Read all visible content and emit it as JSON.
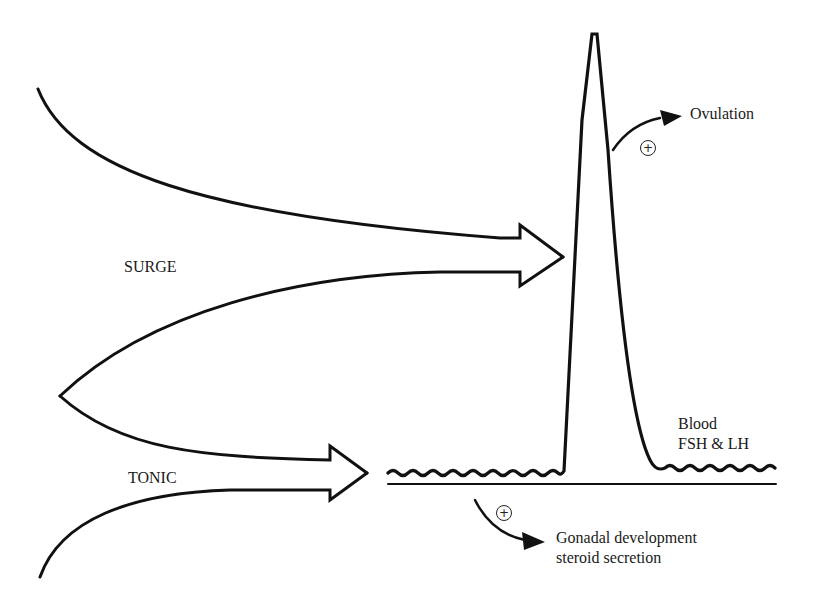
{
  "diagram": {
    "type": "hormone-secretion-schematic",
    "labels": {
      "surge": "SURGE",
      "tonic": "TONIC",
      "ovulation": "Ovulation",
      "blood_line1": "Blood",
      "blood_line2": "FSH & LH",
      "gonadal_line1": "Gonadal development",
      "gonadal_line2": "steroid secretion",
      "plus_sign": "+"
    },
    "colors": {
      "stroke": "#111111",
      "background": "#ffffff",
      "text": "#1a1a1a"
    },
    "nodes": [
      {
        "id": "surge-center",
        "label": "SURGE"
      },
      {
        "id": "tonic-center",
        "label": "TONIC"
      },
      {
        "id": "blood-fsh-lh",
        "label": "Blood FSH & LH"
      },
      {
        "id": "ovulation",
        "label": "Ovulation"
      },
      {
        "id": "gonadal",
        "label": "Gonadal development steroid secretion"
      }
    ],
    "edges": [
      {
        "from": "surge-center",
        "to": "blood-fsh-lh",
        "kind": "hollow-arrow",
        "note": "drives LH/FSH surge peak"
      },
      {
        "from": "tonic-center",
        "to": "blood-fsh-lh",
        "kind": "hollow-arrow",
        "note": "drives basal tonic level"
      },
      {
        "from": "blood-fsh-lh",
        "to": "ovulation",
        "kind": "solid-arrow",
        "sign": "+"
      },
      {
        "from": "blood-fsh-lh",
        "to": "gonadal",
        "kind": "solid-arrow",
        "sign": "+"
      }
    ]
  }
}
